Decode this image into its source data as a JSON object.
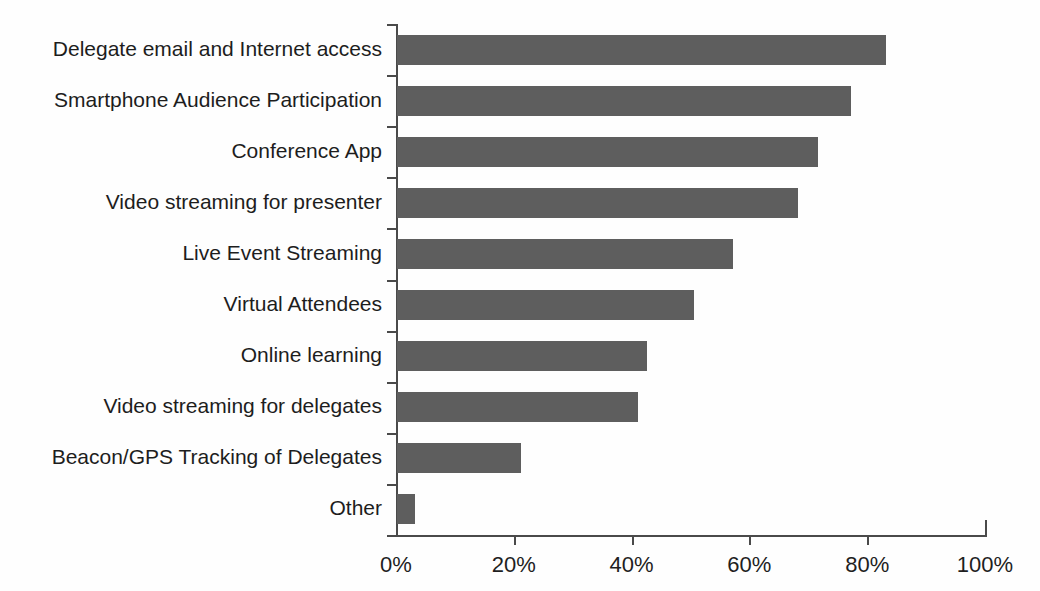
{
  "chart_data": {
    "type": "bar",
    "orientation": "horizontal",
    "title": "",
    "subtitle": "",
    "xlabel": "",
    "ylabel": "",
    "xlim": [
      0,
      100
    ],
    "grid": false,
    "legend": false,
    "bar_color": "#5e5e5e",
    "axis_color": "#4a4a4a",
    "background_color": "#ffffff",
    "value_suffix": "%",
    "categories": [
      "Delegate email and Internet access",
      "Smartphone Audience Participation",
      "Conference App",
      "Video streaming for presenter",
      "Live Event Streaming",
      "Virtual Attendees",
      "Online learning",
      "Video streaming for delegates",
      "Beacon/GPS Tracking of Delegates",
      "Other"
    ],
    "values": [
      83,
      77,
      71.5,
      68,
      57,
      50.5,
      42.5,
      41,
      21,
      3
    ],
    "xticks": [
      0,
      20,
      40,
      60,
      80,
      100
    ],
    "xtick_labels": [
      "0%",
      "20%",
      "40%",
      "60%",
      "80%",
      "100%"
    ]
  }
}
